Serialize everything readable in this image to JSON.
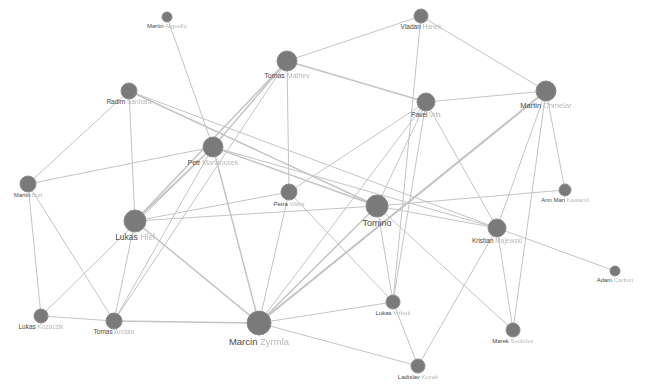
{
  "graph": {
    "type": "network",
    "background": "#ffffff",
    "node_color": "#7a7a7a",
    "edge_color": "#c4c4c4",
    "nodes": [
      {
        "id": "martin_a",
        "first": "Martin",
        "last": "Arguello",
        "x": 167,
        "y": 17,
        "r": 5,
        "fs": 6,
        "lx": 167,
        "ly": 28
      },
      {
        "id": "vladan",
        "first": "Vladan",
        "last": "Hanek",
        "x": 421,
        "y": 16,
        "r": 7,
        "fs": 6.5,
        "lx": 421,
        "ly": 29
      },
      {
        "id": "tomas_m",
        "first": "Tomas",
        "last": "Mathev",
        "x": 287,
        "y": 61,
        "r": 10,
        "fs": 7,
        "lx": 287,
        "ly": 78
      },
      {
        "id": "radim",
        "first": "Radim",
        "last": "Sanhara",
        "x": 129,
        "y": 91,
        "r": 8,
        "fs": 6.5,
        "lx": 129,
        "ly": 104
      },
      {
        "id": "martin_c",
        "first": "Martin",
        "last": "Chmelar",
        "x": 546,
        "y": 91,
        "r": 10,
        "fs": 7.5,
        "lx": 546,
        "ly": 108
      },
      {
        "id": "pavel",
        "first": "Pavel",
        "last": "Vrla",
        "x": 426,
        "y": 102,
        "r": 9,
        "fs": 6.5,
        "lx": 426,
        "ly": 117
      },
      {
        "id": "petr_m",
        "first": "Petr",
        "last": "Marinousek",
        "x": 213,
        "y": 147,
        "r": 10,
        "fs": 7,
        "lx": 213,
        "ly": 165
      },
      {
        "id": "martin_b",
        "first": "Martin",
        "last": "Bolt",
        "x": 28,
        "y": 184,
        "r": 8,
        "fs": 6,
        "lx": 28,
        "ly": 197
      },
      {
        "id": "petra",
        "first": "Petra",
        "last": "Vilikis",
        "x": 289,
        "y": 192,
        "r": 8,
        "fs": 6,
        "lx": 289,
        "ly": 206
      },
      {
        "id": "ann",
        "first": "Ann Mari",
        "last": "Kaaland",
        "x": 565,
        "y": 190,
        "r": 6,
        "fs": 6,
        "lx": 565,
        "ly": 202
      },
      {
        "id": "tomino",
        "first": "Tomino",
        "last": "",
        "x": 377,
        "y": 206,
        "r": 11,
        "fs": 9,
        "lx": 377,
        "ly": 226
      },
      {
        "id": "lukas_h",
        "first": "Lukas",
        "last": "Hlel",
        "x": 135,
        "y": 221,
        "r": 11,
        "fs": 8.5,
        "lx": 135,
        "ly": 240
      },
      {
        "id": "kristian",
        "first": "Kristian",
        "last": "Majewski",
        "x": 497,
        "y": 228,
        "r": 9,
        "fs": 6.5,
        "lx": 497,
        "ly": 243
      },
      {
        "id": "adam",
        "first": "Adam",
        "last": "Carlton",
        "x": 615,
        "y": 271,
        "r": 5,
        "fs": 6,
        "lx": 615,
        "ly": 282
      },
      {
        "id": "lukas_k",
        "first": "Lukas",
        "last": "Kozaczik",
        "x": 41,
        "y": 316,
        "r": 7,
        "fs": 6.5,
        "lx": 41,
        "ly": 329
      },
      {
        "id": "tomas_a",
        "first": "Tomas",
        "last": "Andalo",
        "x": 114,
        "y": 321,
        "r": 8,
        "fs": 6.5,
        "lx": 114,
        "ly": 334
      },
      {
        "id": "lukas_v",
        "first": "Lukas",
        "last": "Vrtbek",
        "x": 393,
        "y": 302,
        "r": 7,
        "fs": 6,
        "lx": 393,
        "ly": 315
      },
      {
        "id": "marek",
        "first": "Marek",
        "last": "Svobdov",
        "x": 513,
        "y": 330,
        "r": 7,
        "fs": 6,
        "lx": 513,
        "ly": 343
      },
      {
        "id": "marcin",
        "first": "Marcin",
        "last": "Zyrmla",
        "x": 259,
        "y": 323,
        "r": 12,
        "fs": 9.5,
        "lx": 259,
        "ly": 345
      },
      {
        "id": "ladislav",
        "first": "Ladislav",
        "last": "Kozak",
        "x": 418,
        "y": 366,
        "r": 7,
        "fs": 6,
        "lx": 418,
        "ly": 379
      }
    ],
    "edges": [
      [
        "martin_a",
        "petr_m",
        1
      ],
      [
        "vladan",
        "tomas_m",
        1
      ],
      [
        "vladan",
        "martin_c",
        1
      ],
      [
        "vladan",
        "lukas_v",
        1
      ],
      [
        "tomas_m",
        "pavel",
        1.5
      ],
      [
        "tomas_m",
        "petr_m",
        1.5
      ],
      [
        "tomas_m",
        "lukas_h",
        1.5
      ],
      [
        "tomas_m",
        "petra",
        1
      ],
      [
        "tomas_m",
        "tomas_a",
        1
      ],
      [
        "radim",
        "lukas_h",
        1
      ],
      [
        "radim",
        "martin_b",
        1
      ],
      [
        "radim",
        "tomino",
        1.5
      ],
      [
        "radim",
        "kristian",
        1
      ],
      [
        "martin_c",
        "pavel",
        1
      ],
      [
        "martin_c",
        "marcin",
        2
      ],
      [
        "martin_c",
        "kristian",
        1
      ],
      [
        "martin_c",
        "marek",
        1
      ],
      [
        "martin_c",
        "ann",
        1
      ],
      [
        "pavel",
        "petra",
        1
      ],
      [
        "pavel",
        "tomino",
        1
      ],
      [
        "pavel",
        "kristian",
        1
      ],
      [
        "pavel",
        "lukas_v",
        1
      ],
      [
        "pavel",
        "marcin",
        1
      ],
      [
        "petr_m",
        "martin_b",
        1
      ],
      [
        "petr_m",
        "tomino",
        1.5
      ],
      [
        "petr_m",
        "lukas_h",
        1.5
      ],
      [
        "petr_m",
        "marcin",
        1.5
      ],
      [
        "petr_m",
        "tomas_a",
        1
      ],
      [
        "petr_m",
        "lukas_k",
        1
      ],
      [
        "petr_m",
        "kristian",
        1
      ],
      [
        "martin_b",
        "lukas_k",
        1
      ],
      [
        "martin_b",
        "tomas_a",
        1
      ],
      [
        "petra",
        "lukas_h",
        1
      ],
      [
        "petra",
        "lukas_v",
        1
      ],
      [
        "petra",
        "marcin",
        1
      ],
      [
        "tomino",
        "lukas_h",
        1
      ],
      [
        "tomino",
        "ann",
        1
      ],
      [
        "tomino",
        "marcin",
        1.5
      ],
      [
        "tomino",
        "lukas_v",
        1
      ],
      [
        "tomino",
        "marek",
        1
      ],
      [
        "tomino",
        "kristian",
        1
      ],
      [
        "lukas_h",
        "marcin",
        1.5
      ],
      [
        "lukas_h",
        "tomas_a",
        1
      ],
      [
        "kristian",
        "adam",
        1
      ],
      [
        "kristian",
        "ladislav",
        1
      ],
      [
        "kristian",
        "marek",
        1
      ],
      [
        "lukas_k",
        "tomas_a",
        1
      ],
      [
        "tomas_a",
        "marcin",
        1.5
      ],
      [
        "marcin",
        "lukas_v",
        1
      ],
      [
        "marcin",
        "ladislav",
        1
      ],
      [
        "lukas_v",
        "ladislav",
        1
      ]
    ]
  }
}
